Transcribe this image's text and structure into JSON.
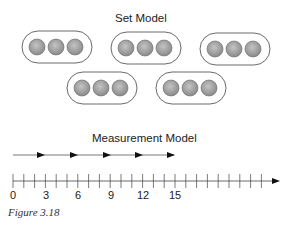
{
  "set_model": {
    "title": "Set Model",
    "groups": [
      {
        "coins": 3
      },
      {
        "coins": 3
      },
      {
        "coins": 3
      },
      {
        "coins": 3
      },
      {
        "coins": 3
      }
    ],
    "coin_label": "quarter"
  },
  "measurement_model": {
    "title": "Measurement Model",
    "jumps": 5,
    "jump_size": 3,
    "tick_labels": [
      "0",
      "3",
      "6",
      "9",
      "12",
      "15"
    ]
  },
  "caption": "Figure 3.18",
  "colors": {
    "line": "#444444",
    "coin_fill": "#9a9a9a",
    "coin_edge": "#555555",
    "arrow": "#111111"
  }
}
